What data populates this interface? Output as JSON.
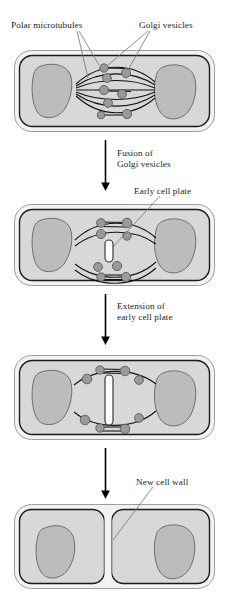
{
  "figure": {
    "type": "biology-process-diagram",
    "background_color": "#ffffff"
  },
  "colors": {
    "cell_wall_outer": "#f2f2f2",
    "cell_outline": "#1a1a1a",
    "cytoplasm": "#d8d8d8",
    "nucleus_fill": "#bcbcbc",
    "nucleus_outline": "#6e6e6e",
    "vesicle_fill": "#9a9a9a",
    "vesicle_outline": "#5a5a5a",
    "microtubule": "#111111",
    "cell_plate_fill": "#ffffff",
    "leader_line": "#7a7a7a",
    "arrow": "#000000",
    "text": "#1c1c1c"
  },
  "labels": {
    "polar_microtubules": "Polar microtubules",
    "golgi_vesicles": "Golgi vesicles",
    "early_cell_plate": "Early cell plate",
    "new_cell_wall": "New cell wall"
  },
  "steps": [
    {
      "id": "step-1",
      "stage_label": "Polar microtubules with Golgi vesicles",
      "vesicle_count": 9,
      "cell_plate": "none"
    },
    {
      "id": "step-2",
      "stage_label": "Early cell plate forms",
      "vesicle_count": 7,
      "cell_plate": "small"
    },
    {
      "id": "step-3",
      "stage_label": "Cell plate extends",
      "vesicle_count": 10,
      "cell_plate": "extended"
    },
    {
      "id": "step-4",
      "stage_label": "Two daughter cells with new cell wall",
      "vesicle_count": 0,
      "cell_plate": "complete"
    }
  ],
  "arrows": [
    {
      "id": "arrow-1",
      "text": "Fusion of\nGolgi vesicles"
    },
    {
      "id": "arrow-2",
      "text": "Extension of\nearly cell plate"
    },
    {
      "id": "arrow-3",
      "text": ""
    }
  ]
}
